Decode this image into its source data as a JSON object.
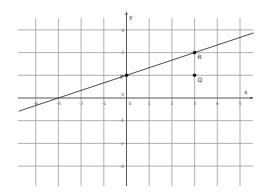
{
  "chart_data": {
    "type": "line",
    "title": "",
    "xlabel": "x",
    "ylabel": "y",
    "xlim": [
      -4.8,
      5.6
    ],
    "ylim": [
      -3.8,
      3.8
    ],
    "grid": true,
    "x_ticks": [
      -4,
      -3,
      -2,
      -1,
      0,
      1,
      2,
      3,
      4,
      5
    ],
    "y_ticks": [
      3,
      2,
      1,
      0,
      -1,
      -2,
      -3
    ],
    "x_tick_labels": [
      "-4",
      "-3",
      "-2",
      "-1",
      "0",
      "1",
      "2",
      "3",
      "4",
      "5"
    ],
    "y_tick_labels": [
      "3",
      "2",
      "",
      "0",
      "-1",
      "-2",
      "-3"
    ],
    "series": [
      {
        "name": "line through P and R",
        "slope": 0.3333,
        "intercept": 1,
        "x": [
          -4.75,
          5.6
        ],
        "y": [
          -0.583,
          2.867
        ]
      }
    ],
    "points": [
      {
        "label": "P",
        "x": 0,
        "y": 1
      },
      {
        "label": "R",
        "x": 3,
        "y": 2
      },
      {
        "label": "Q",
        "x": 3,
        "y": 1
      }
    ],
    "annotations": [
      "P",
      "Q",
      "R"
    ]
  },
  "colors": {
    "grid": "#9a9a9a",
    "axis": "#444444",
    "line": "#333333",
    "point": "#111111",
    "background": "#ffffff"
  }
}
